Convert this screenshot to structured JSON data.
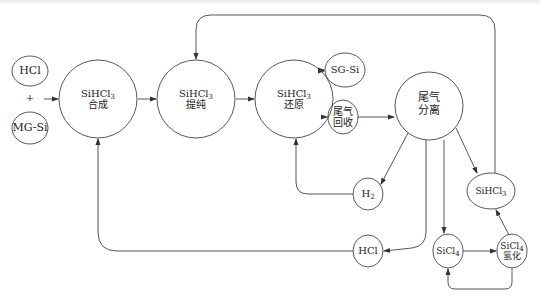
{
  "diagram": {
    "type": "process-flow",
    "nodes": [
      {
        "id": "hcl_in",
        "label": "HCl"
      },
      {
        "id": "plus",
        "label": "+"
      },
      {
        "id": "mg_si",
        "label": "MG-Si"
      },
      {
        "id": "synth",
        "formula": "SiHCl",
        "sub": "3",
        "label": "合成"
      },
      {
        "id": "purify",
        "formula": "SiHCl",
        "sub": "3",
        "label": "提纯"
      },
      {
        "id": "reduce",
        "formula": "SiHCl",
        "sub": "3",
        "label": "还原"
      },
      {
        "id": "sg_si",
        "label": "SG-Si"
      },
      {
        "id": "tail_recover",
        "line1": "尾气",
        "line2": "回收"
      },
      {
        "id": "tail_separate",
        "line1": "尾气",
        "line2": "分离"
      },
      {
        "id": "h2",
        "formula": "H",
        "sub": "2"
      },
      {
        "id": "hcl_out",
        "label": "HCl"
      },
      {
        "id": "sicl4",
        "formula": "SiCl",
        "sub": "4"
      },
      {
        "id": "sihcl3_out",
        "formula": "SiHCl",
        "sub": "3"
      },
      {
        "id": "sicl4_hydro",
        "formula": "SiCl",
        "sub": "4",
        "label": "氢化"
      }
    ],
    "edges": [
      [
        "hcl_in+mg_si",
        "synth"
      ],
      [
        "synth",
        "purify"
      ],
      [
        "purify",
        "reduce"
      ],
      [
        "reduce",
        "sg_si"
      ],
      [
        "reduce",
        "tail_recover"
      ],
      [
        "tail_recover",
        "tail_separate"
      ],
      [
        "tail_separate",
        "h2"
      ],
      [
        "h2",
        "reduce"
      ],
      [
        "tail_separate",
        "hcl_out"
      ],
      [
        "hcl_out",
        "synth"
      ],
      [
        "tail_separate",
        "sicl4"
      ],
      [
        "tail_separate",
        "sihcl3_out"
      ],
      [
        "sihcl3_out",
        "purify"
      ],
      [
        "sicl4",
        "sicl4_hydro"
      ],
      [
        "sicl4_hydro",
        "sihcl3_out"
      ],
      [
        "sicl4_hydro",
        "sicl4"
      ]
    ]
  }
}
